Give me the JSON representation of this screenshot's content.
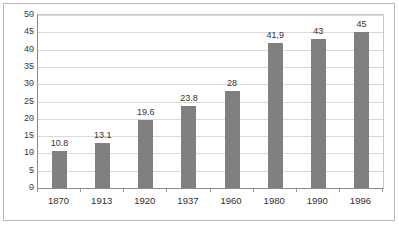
{
  "chart_data": {
    "type": "bar",
    "title": "",
    "xlabel": "",
    "ylabel": "",
    "categories": [
      "1870",
      "1913",
      "1920",
      "1937",
      "1960",
      "1980",
      "1990",
      "1996"
    ],
    "values": [
      10.8,
      13.1,
      19.6,
      23.8,
      28,
      41.9,
      43,
      45
    ],
    "value_labels": [
      "10.8",
      "13.1",
      "19.6",
      "23.8",
      "28",
      "41,9",
      "43",
      "45"
    ],
    "ylim": [
      0,
      50
    ],
    "ytick_labels": [
      "0",
      "5",
      "10",
      "15",
      "20",
      "25",
      "30",
      "35",
      "40",
      "45",
      "50"
    ],
    "ytick_values": [
      0,
      5,
      10,
      15,
      20,
      25,
      30,
      35,
      40,
      45,
      50
    ],
    "grid": true,
    "legend": null,
    "bar_color": "#808080",
    "grid_color": "#d9d9d9",
    "axis_color": "#8a8a8a",
    "background_color": "#ffffff"
  }
}
